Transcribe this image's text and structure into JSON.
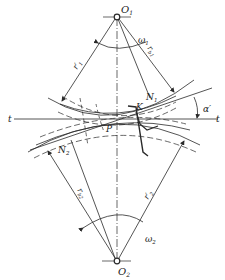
{
  "diagram": {
    "type": "gear-meshing-diagram",
    "labels": {
      "o1": "O",
      "o1_sub": "1",
      "o2": "O",
      "o2_sub": "2",
      "omega1": "ω",
      "omega1_sub": "1",
      "omega2": "ω",
      "omega2_sub": "2",
      "r1_prime": "r′",
      "r1_prime_sub": "1",
      "rb1": "r",
      "rb1_sub": "b1",
      "r2_prime": "r′",
      "r2_prime_sub": "2",
      "rb2": "r",
      "rb2_sub": "b2",
      "n1": "N",
      "n1_sub": "1",
      "n2": "N",
      "n2_sub": "2",
      "k": "K",
      "p": "P",
      "alpha_prime": "α′",
      "t_left": "t",
      "t_right": "t"
    },
    "colors": {
      "line": "#2a2a2a",
      "background": "#ffffff"
    }
  }
}
